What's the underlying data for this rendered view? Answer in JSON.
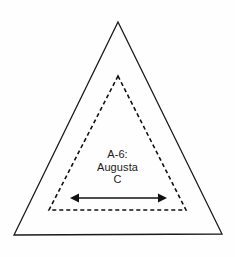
{
  "figure": {
    "title": "",
    "background_color": "#fefefe",
    "width": 235,
    "height": 257
  },
  "label": {
    "line1": "A-6:",
    "line2": "Augusta",
    "line3": "C",
    "full_text": "A-6: Augusta C",
    "code": "A-6",
    "name": "Augusta",
    "suffix": "C",
    "color": "#1b1b1b"
  },
  "shapes": {
    "outer_triangle": {
      "name": "outer-triangle",
      "style": "solid",
      "stroke_color": "#1a1a1a",
      "stroke_width": 1.3,
      "fill": "none",
      "points": "118,22 222,234 14,235"
    },
    "inner_triangle": {
      "name": "inner-dashed-triangle",
      "style": "dashed",
      "stroke_color": "#111111",
      "stroke_width": 1.6,
      "dash_pattern": "4 3",
      "fill": "none",
      "points": "118,76 186,210 49,210"
    },
    "arrow": {
      "name": "double-headed-arrow",
      "stroke_color": "#111111",
      "stroke_width": 1.5,
      "y": 198,
      "x_start": 70,
      "x_end": 167,
      "head_length": 9,
      "head_half_width": 4.5,
      "direction": "both"
    }
  }
}
